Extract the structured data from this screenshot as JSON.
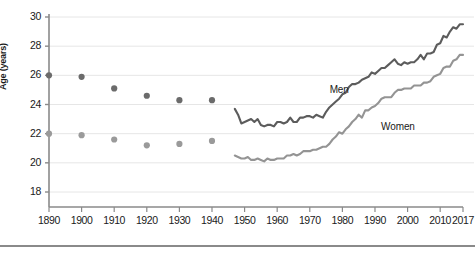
{
  "chart_data": {
    "type": "line",
    "title": "",
    "xlabel": "",
    "ylabel": "Age (years)",
    "xlim": [
      1890,
      2017
    ],
    "ylim": [
      17,
      30
    ],
    "yticks": [
      30,
      28,
      26,
      24,
      22,
      20,
      18
    ],
    "xticks": [
      1890,
      1900,
      1910,
      1920,
      1930,
      1940,
      1950,
      1960,
      1970,
      1980,
      1990,
      2000,
      2010,
      2017
    ],
    "grid": "horizontal",
    "legend_position": "inline-annotation",
    "annotations": [
      {
        "text": "Men",
        "x": 1981,
        "y": 24.9
      },
      {
        "text": "Women",
        "x": 1998,
        "y": 22.4
      }
    ],
    "colors": {
      "men": "#5c5c5c",
      "women": "#949494",
      "men_marker": "#6b6b6b",
      "women_marker": "#9a9a9a",
      "grid": "#e6e6e6",
      "axis": "#8a8a8a",
      "text": "#1a1a1a"
    },
    "series": [
      {
        "name": "Men",
        "style": "scatter",
        "x": [
          1890,
          1900,
          1910,
          1920,
          1930,
          1940
        ],
        "values": [
          26.0,
          25.9,
          25.1,
          24.6,
          24.3,
          24.3
        ]
      },
      {
        "name": "Women",
        "style": "scatter",
        "x": [
          1890,
          1900,
          1910,
          1920,
          1930,
          1940
        ],
        "values": [
          22.0,
          21.9,
          21.6,
          21.2,
          21.3,
          21.5
        ]
      },
      {
        "name": "Men",
        "style": "line",
        "x": [
          1947,
          1948,
          1949,
          1950,
          1951,
          1952,
          1953,
          1954,
          1955,
          1956,
          1957,
          1958,
          1959,
          1960,
          1961,
          1962,
          1963,
          1964,
          1965,
          1966,
          1967,
          1968,
          1969,
          1970,
          1971,
          1972,
          1973,
          1974,
          1975,
          1976,
          1977,
          1978,
          1979,
          1980,
          1981,
          1982,
          1983,
          1984,
          1985,
          1986,
          1987,
          1988,
          1989,
          1990,
          1991,
          1992,
          1993,
          1994,
          1995,
          1996,
          1997,
          1998,
          1999,
          2000,
          2001,
          2002,
          2003,
          2004,
          2005,
          2006,
          2007,
          2008,
          2009,
          2010,
          2011,
          2012,
          2013,
          2014,
          2015,
          2016,
          2017
        ],
        "values": [
          23.7,
          23.3,
          22.7,
          22.8,
          22.9,
          23.0,
          22.8,
          23.0,
          22.6,
          22.5,
          22.6,
          22.6,
          22.5,
          22.8,
          22.8,
          22.7,
          22.8,
          23.1,
          22.8,
          22.8,
          23.1,
          23.1,
          23.2,
          23.2,
          23.1,
          23.3,
          23.2,
          23.1,
          23.5,
          23.8,
          24.0,
          24.2,
          24.4,
          24.7,
          24.8,
          25.2,
          25.4,
          25.4,
          25.5,
          25.7,
          25.8,
          25.9,
          26.2,
          26.1,
          26.3,
          26.5,
          26.5,
          26.7,
          26.9,
          27.1,
          26.8,
          26.7,
          26.9,
          26.8,
          26.9,
          26.9,
          27.1,
          27.4,
          27.1,
          27.5,
          27.5,
          27.6,
          28.1,
          28.2,
          28.7,
          28.6,
          29.0,
          29.3,
          29.2,
          29.5,
          29.5
        ]
      },
      {
        "name": "Women",
        "style": "line",
        "x": [
          1947,
          1948,
          1949,
          1950,
          1951,
          1952,
          1953,
          1954,
          1955,
          1956,
          1957,
          1958,
          1959,
          1960,
          1961,
          1962,
          1963,
          1964,
          1965,
          1966,
          1967,
          1968,
          1969,
          1970,
          1971,
          1972,
          1973,
          1974,
          1975,
          1976,
          1977,
          1978,
          1979,
          1980,
          1981,
          1982,
          1983,
          1984,
          1985,
          1986,
          1987,
          1988,
          1989,
          1990,
          1991,
          1992,
          1993,
          1994,
          1995,
          1996,
          1997,
          1998,
          1999,
          2000,
          2001,
          2002,
          2003,
          2004,
          2005,
          2006,
          2007,
          2008,
          2009,
          2010,
          2011,
          2012,
          2013,
          2014,
          2015,
          2016,
          2017
        ],
        "values": [
          20.5,
          20.4,
          20.3,
          20.3,
          20.4,
          20.2,
          20.2,
          20.3,
          20.2,
          20.1,
          20.3,
          20.2,
          20.2,
          20.3,
          20.3,
          20.3,
          20.5,
          20.5,
          20.6,
          20.5,
          20.6,
          20.8,
          20.8,
          20.8,
          20.9,
          20.9,
          21.0,
          21.1,
          21.1,
          21.3,
          21.6,
          21.8,
          22.1,
          22.0,
          22.3,
          22.5,
          22.8,
          23.0,
          23.3,
          23.1,
          23.6,
          23.6,
          23.8,
          23.9,
          24.1,
          24.4,
          24.5,
          24.5,
          24.5,
          24.8,
          25.0,
          25.0,
          25.1,
          25.1,
          25.1,
          25.3,
          25.3,
          25.3,
          25.5,
          25.5,
          25.6,
          25.9,
          26.0,
          26.1,
          26.5,
          26.6,
          26.6,
          27.0,
          27.1,
          27.4,
          27.4
        ]
      }
    ]
  },
  "axis": {
    "y_title": "Age (years)",
    "y_ticks": [
      "30",
      "28",
      "26",
      "24",
      "22",
      "20",
      "18"
    ],
    "x_ticks": [
      "1890",
      "1900",
      "1910",
      "1920",
      "1930",
      "1940",
      "1950",
      "1960",
      "1970",
      "1980",
      "1990",
      "2000",
      "2010",
      "2017"
    ]
  },
  "labels": {
    "men": "Men",
    "women": "Women"
  }
}
